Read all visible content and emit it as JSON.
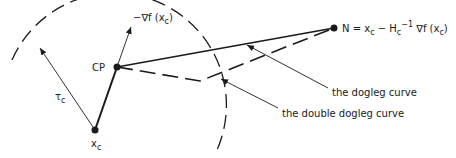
{
  "diagram": {
    "points": {
      "xc": {
        "label": "x",
        "sub": "c",
        "x": 95,
        "y": 130
      },
      "cp": {
        "label": "CP",
        "x": 117,
        "y": 67
      },
      "n": {
        "label": "N = x",
        "x": 334,
        "y": 28
      },
      "double_dogleg_corner": {
        "x": 200,
        "y": 81
      }
    },
    "labels": {
      "gradient": {
        "prefix": "−∇f (x",
        "sub": "c",
        "suffix": ")"
      },
      "radius": {
        "main": "τ",
        "sub": "c"
      },
      "newton": {
        "n_part": "N = x",
        "n_sub": "c",
        "minus": " − H",
        "h_sub": "c",
        "h_sup": "−1",
        "grad": " ∇f (x",
        "grad_sub": "c",
        "close": ")"
      },
      "dogleg": "the dogleg curve",
      "double_dogleg": "the double dogleg curve"
    },
    "colors": {
      "ink": "#1a1a1a",
      "background": "#ffffff"
    }
  }
}
